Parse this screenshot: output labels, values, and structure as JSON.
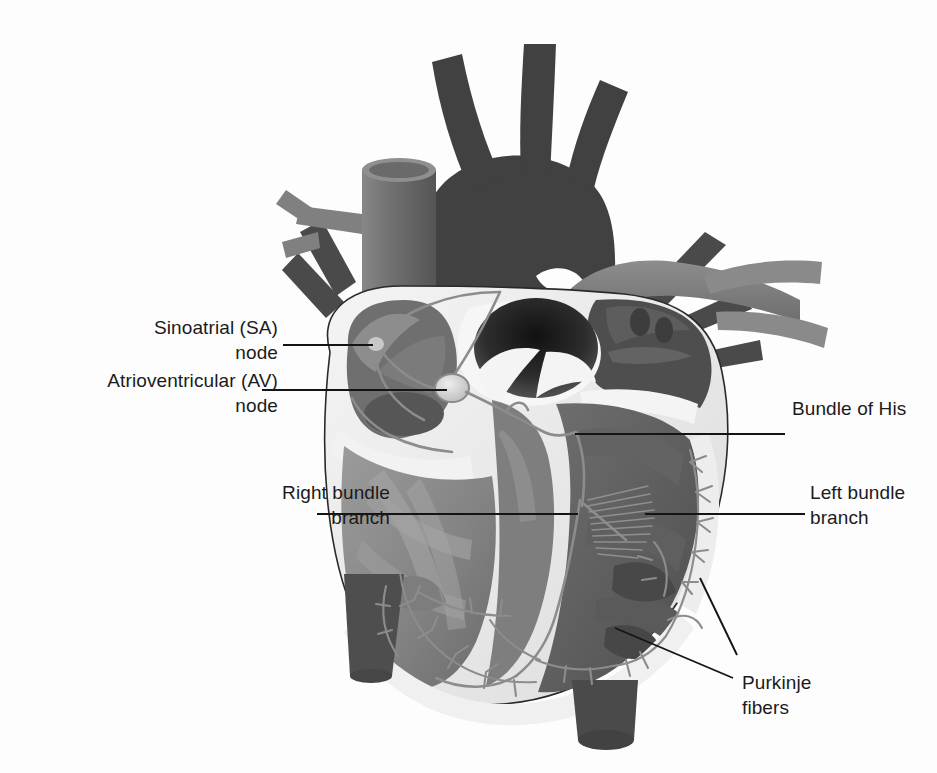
{
  "figure": {
    "background_color": "#fdfdfd",
    "label_color": "#1b1b1b",
    "leader_color": "#141414"
  },
  "labels": [
    {
      "id": "sa-node",
      "text": "Sinoatrial (SA)\nnode",
      "align": "right",
      "x": 28,
      "y": 315,
      "w": 250
    },
    {
      "id": "av-node",
      "text": "Atrioventricular (AV)\nnode",
      "align": "right",
      "x": 8,
      "y": 368,
      "w": 270
    },
    {
      "id": "bundle-of-his",
      "text": "Bundle of His",
      "align": "left",
      "x": 792,
      "y": 396,
      "w": 200
    },
    {
      "id": "left-bundle-branch",
      "text": "Left bundle\nbranch",
      "align": "left",
      "x": 810,
      "y": 480,
      "w": 160
    },
    {
      "id": "right-bundle-branch",
      "text": "Right bundle\nbranch",
      "align": "right",
      "x": 180,
      "y": 480,
      "w": 210
    },
    {
      "id": "purkinje-fibers",
      "text": "Purkinje\nfibers",
      "align": "left",
      "x": 742,
      "y": 670,
      "w": 160
    }
  ],
  "leaders": [
    {
      "id": "leader-sa-node",
      "points": "283,345 373,345"
    },
    {
      "id": "leader-av-node",
      "points": "262,390 447,390"
    },
    {
      "id": "leader-bundle-of-his",
      "points": "785,434 575,434"
    },
    {
      "id": "leader-left-bundle-branch",
      "points": "805,514 645,514"
    },
    {
      "id": "leader-right-bundle-branch",
      "points": "317,514 578,514"
    },
    {
      "id": "leader-purkinje-upper",
      "points": "737,655 700,578"
    },
    {
      "id": "leader-purkinje-lower",
      "points": "733,678 615,628"
    }
  ],
  "anatomy": {
    "aorta": "aortic-arch-with-brachiocephalic-branches",
    "superior_vena_cava": "svc-cylinder",
    "pulmonary_artery": "pulmonary-trunk-and-branches",
    "pulmonary_veins": "pulmonary-vein-stumps",
    "inferior_vena_cava": "ivc-stump",
    "descending_aorta": "descending-aorta-stump",
    "right_atrium": "right-atrium-cutaway",
    "left_atrium": "left-atrium-cutaway",
    "right_ventricle": "right-ventricle-cutaway",
    "left_ventricle": "left-ventricle-cutaway",
    "septum": "interventricular-septum",
    "conduction": "sa-node, internodal-tracts, av-node, bundle-of-his, right-and-left-bundle-branches, purkinje-network"
  },
  "palette": {
    "vessel_dark": "#4a4a4a",
    "vessel_mid": "#6f6f6f",
    "muscle_dark": "#5d5d5d",
    "muscle_mid": "#8a8a8a",
    "muscle_light": "#a8a8a8",
    "endocardium": "#efefef",
    "epicardium": "#e2e2e2",
    "chamber_void": "#2b2b2b",
    "conduction_fiber": "#8e8e8e",
    "node_highlight": "#d8d8d8"
  }
}
